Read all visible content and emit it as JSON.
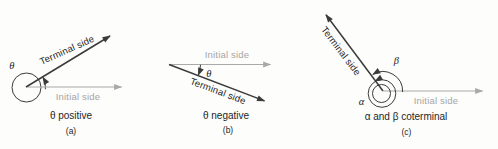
{
  "figure": {
    "background": "#fdfdfb",
    "colors": {
      "stroke_dark": "#3b3b3b",
      "stroke_gray": "#a9a9a9",
      "text_dark": "#262626",
      "text_gray": "#a5a5a5"
    },
    "panels": [
      {
        "terminal_label": "Terminal side",
        "initial_label": "Initial side",
        "angle_label": "θ",
        "caption": "θ positive",
        "tag": "(a)"
      },
      {
        "terminal_label": "Terminal side",
        "initial_label": "Initial side",
        "angle_label": "θ",
        "caption": "θ negative",
        "tag": "(b)"
      },
      {
        "terminal_label": "Terminal side",
        "initial_label": "Initial side",
        "alpha_label": "α",
        "beta_label": "β",
        "caption": "α and β coterminal",
        "tag": "(c)"
      }
    ]
  }
}
